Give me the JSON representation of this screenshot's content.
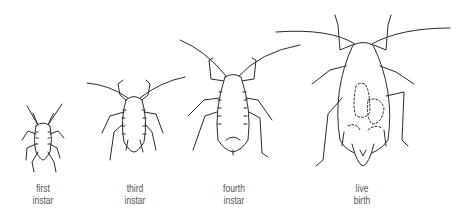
{
  "stages": [
    {
      "id": "first-instar",
      "line1": "first",
      "line2": "instar",
      "center_x": 43
    },
    {
      "id": "third-instar",
      "line1": "third",
      "line2": "instar",
      "center_x": 135
    },
    {
      "id": "fourth-instar",
      "line1": "fourth",
      "line2": "instar",
      "center_x": 234
    },
    {
      "id": "live-birth",
      "line1": "live",
      "line2": "birth",
      "center_x": 362
    }
  ],
  "colors": {
    "ink": "#2a2a2a",
    "label": "#555555",
    "background": "#ffffff"
  }
}
